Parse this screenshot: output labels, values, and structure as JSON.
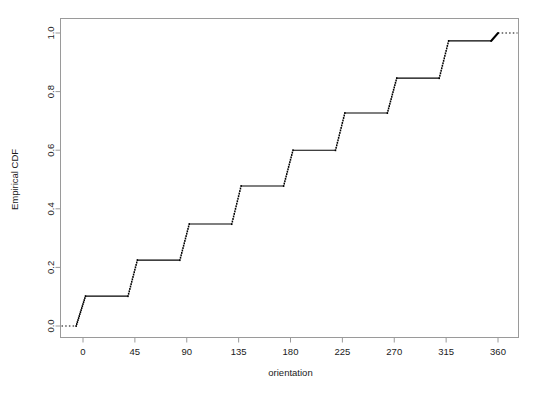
{
  "chart_data": {
    "type": "line",
    "subtype": "empirical-cdf-step",
    "title": "",
    "xlabel": "orientation",
    "ylabel": "Empirical CDF",
    "xlim": [
      -22,
      382
    ],
    "ylim": [
      -0.04,
      1.04
    ],
    "grid": false,
    "legend": null,
    "x_ticks": [
      0,
      45,
      90,
      135,
      180,
      225,
      270,
      315,
      360
    ],
    "x_tick_labels": [
      "0",
      "45",
      "90",
      "135",
      "180",
      "225",
      "270",
      "315",
      "360"
    ],
    "y_ticks": [
      0.0,
      0.2,
      0.4,
      0.6,
      0.8,
      1.0
    ],
    "y_tick_labels": [
      "0.0",
      "0.2",
      "0.4",
      "0.6",
      "0.8",
      "1.0"
    ],
    "line_color": "#000000",
    "box_color": "#9a9a9a",
    "step_x": [
      0,
      45,
      90,
      135,
      180,
      225,
      270,
      315,
      360
    ],
    "step_y": [
      0.102,
      0.225,
      0.348,
      0.478,
      0.6,
      0.727,
      0.846,
      0.973,
      1.0
    ],
    "jump_spread": 6,
    "jump_points": 16,
    "left_tail_y": 0.0,
    "right_tail_y": 1.0,
    "points": [
      {
        "x": 0,
        "y": 0.102
      },
      {
        "x": 45,
        "y": 0.225
      },
      {
        "x": 90,
        "y": 0.348
      },
      {
        "x": 135,
        "y": 0.478
      },
      {
        "x": 180,
        "y": 0.6
      },
      {
        "x": 225,
        "y": 0.727
      },
      {
        "x": 270,
        "y": 0.846
      },
      {
        "x": 315,
        "y": 0.973
      },
      {
        "x": 360,
        "y": 1.0
      }
    ]
  }
}
